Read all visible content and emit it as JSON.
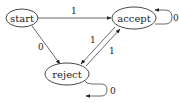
{
  "diagram": {
    "type": "finite-state-automaton",
    "states": [
      {
        "id": "start",
        "label": "start"
      },
      {
        "id": "accept",
        "label": "accept"
      },
      {
        "id": "reject",
        "label": "reject"
      }
    ],
    "transitions": [
      {
        "from": "start",
        "to": "accept",
        "label": "1"
      },
      {
        "from": "start",
        "to": "reject",
        "label": "0"
      },
      {
        "from": "accept",
        "to": "accept",
        "label": "0"
      },
      {
        "from": "accept",
        "to": "reject",
        "label": "1"
      },
      {
        "from": "reject",
        "to": "accept",
        "label": "1"
      },
      {
        "from": "reject",
        "to": "reject",
        "label": "0"
      }
    ]
  },
  "colors": {
    "stroke": "#333333",
    "background": "#ffffff"
  }
}
